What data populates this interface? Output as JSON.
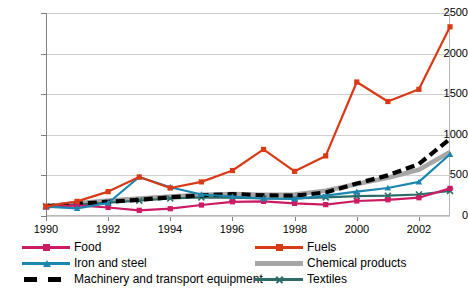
{
  "chart_data": {
    "type": "line",
    "title": "",
    "xlabel": "",
    "ylabel": "",
    "x": [
      1990,
      1991,
      1992,
      1993,
      1994,
      1995,
      1996,
      1997,
      1998,
      1999,
      2000,
      2001,
      2002,
      2003
    ],
    "xlim": [
      1990,
      2003
    ],
    "ylim": [
      0,
      2500
    ],
    "ytick_values": [
      0,
      500,
      1000,
      1500,
      2000,
      2500
    ],
    "ytick_labels": [
      "0",
      "500",
      "1000",
      "1500",
      "2000",
      "2500"
    ],
    "xtick_values": [
      1990,
      1992,
      1994,
      1996,
      1998,
      2000,
      2002
    ],
    "xtick_labels": [
      "1990",
      "1992",
      "1994",
      "1996",
      "1998",
      "2000",
      "2002"
    ],
    "grid": true,
    "legend_position": "bottom",
    "series": [
      {
        "name": "Food",
        "color": "#CC1B63",
        "marker": "square",
        "style": "solid",
        "values": [
          110,
          130,
          105,
          70,
          90,
          135,
          175,
          180,
          155,
          140,
          185,
          200,
          225,
          340
        ]
      },
      {
        "name": "Iron and steel",
        "color": "#1C86B0",
        "marker": "triangle",
        "style": "solid",
        "values": [
          115,
          95,
          160,
          480,
          355,
          265,
          240,
          215,
          210,
          250,
          300,
          345,
          420,
          760
        ]
      },
      {
        "name": "Machinery and transport equipment",
        "color": "#000000",
        "marker": "none",
        "style": "dashed",
        "values": [
          120,
          150,
          175,
          200,
          230,
          255,
          270,
          255,
          250,
          290,
          400,
          500,
          640,
          950
        ]
      },
      {
        "name": "Fuels",
        "color": "#D93A16",
        "marker": "square",
        "style": "solid",
        "values": [
          120,
          180,
          300,
          480,
          345,
          420,
          560,
          820,
          550,
          740,
          1650,
          1410,
          1560,
          2330
        ]
      },
      {
        "name": "Chemical products",
        "color": "#A6A6A6",
        "marker": "none",
        "style": "thick",
        "values": [
          120,
          155,
          190,
          215,
          240,
          260,
          270,
          260,
          265,
          310,
          395,
          470,
          570,
          790
        ]
      },
      {
        "name": "Textiles",
        "color": "#2C6B68",
        "marker": "x",
        "style": "solid",
        "values": [
          118,
          140,
          165,
          190,
          215,
          230,
          225,
          215,
          215,
          230,
          245,
          250,
          265,
          310
        ]
      }
    ]
  }
}
